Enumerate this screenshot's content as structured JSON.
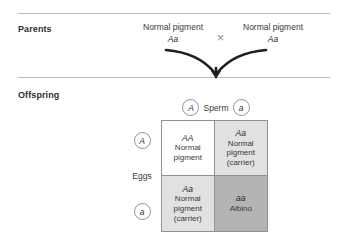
{
  "figure": {
    "sections": {
      "parents_label": "Parents",
      "offspring_label": "Offspring"
    },
    "parents": {
      "mother": {
        "phenotype": "Normal pigment",
        "genotype": "Aa"
      },
      "father": {
        "phenotype": "Normal pigment",
        "genotype": "Aa"
      },
      "cross_symbol": "×"
    },
    "punnett": {
      "sperm_axis_label": "Sperm",
      "eggs_axis_label": "Eggs",
      "sperm_alleles": [
        "A",
        "a"
      ],
      "egg_alleles": [
        "A",
        "a"
      ],
      "cells": [
        {
          "genotype": "AA",
          "phenotype_line1": "Normal",
          "phenotype_line2": "pigment",
          "phenotype_line3": "",
          "shade": "none"
        },
        {
          "genotype": "Aa",
          "phenotype_line1": "Normal",
          "phenotype_line2": "pigment",
          "phenotype_line3": "(carrier)",
          "shade": "light"
        },
        {
          "genotype": "Aa",
          "phenotype_line1": "Normal",
          "phenotype_line2": "pigment",
          "phenotype_line3": "(carrier)",
          "shade": "light"
        },
        {
          "genotype": "aa",
          "phenotype_line1": "Albino",
          "phenotype_line2": "",
          "phenotype_line3": "",
          "shade": "dark"
        }
      ]
    },
    "colors": {
      "rule": "#b9bcc0",
      "stroke": "#8e9297",
      "arrow": "#1f1f1f",
      "cell_light": "#e1e1e1",
      "cell_dark": "#b4b4b4",
      "text": "#3a3a3a"
    }
  }
}
